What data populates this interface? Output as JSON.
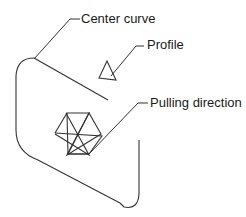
{
  "diagram": {
    "labels": {
      "center_curve": "Center curve",
      "profile": "Profile",
      "pulling_direction": "Pulling direction"
    },
    "colors": {
      "stroke": "#333333",
      "text": "#1a1a1a",
      "background": "#ffffff"
    },
    "shapes": [
      "center-curve-path",
      "profile-triangle",
      "pulling-direction-star"
    ]
  }
}
